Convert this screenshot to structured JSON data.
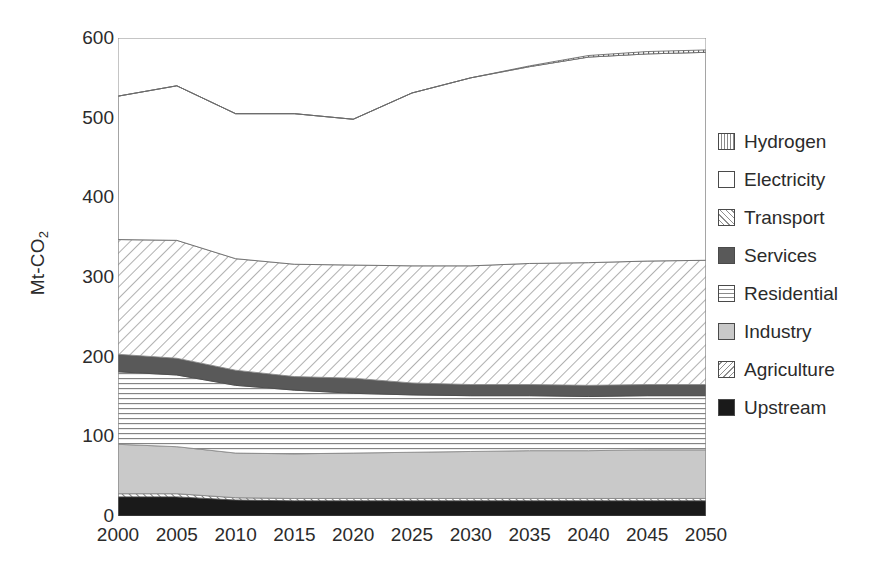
{
  "axes": {
    "ylabel": "Mt-CO",
    "ylabel_sub": "2",
    "yticks": [
      "0",
      "100",
      "200",
      "300",
      "400",
      "500",
      "600"
    ],
    "xticks": [
      "2000",
      "2005",
      "2010",
      "2015",
      "2020",
      "2025",
      "2030",
      "2035",
      "2040",
      "2045",
      "2050"
    ]
  },
  "legend": {
    "items": [
      {
        "label": "Hydrogen",
        "swatch": "hydrogen",
        "icon": "vertical-hatch-swatch-icon"
      },
      {
        "label": "Electricity",
        "swatch": "electricity",
        "icon": "white-swatch-icon"
      },
      {
        "label": "Transport",
        "swatch": "transport",
        "icon": "diagonal-hatch-swatch-icon"
      },
      {
        "label": "Services",
        "swatch": "services",
        "icon": "dark-gray-swatch-icon"
      },
      {
        "label": "Residential",
        "swatch": "residential",
        "icon": "horizontal-hatch-swatch-icon"
      },
      {
        "label": "Industry",
        "swatch": "industry",
        "icon": "light-gray-swatch-icon"
      },
      {
        "label": "Agriculture",
        "swatch": "agriculture",
        "icon": "back-diagonal-hatch-swatch-icon"
      },
      {
        "label": "Upstream",
        "swatch": "upstream",
        "icon": "black-swatch-icon"
      }
    ]
  },
  "chart_data": {
    "type": "area",
    "title": "",
    "xlabel": "",
    "ylabel": "Mt-CO2",
    "stacked": true,
    "grid": false,
    "legend_position": "right",
    "xlim": [
      2000,
      2050
    ],
    "ylim": [
      0,
      600
    ],
    "x": [
      2000,
      2005,
      2010,
      2015,
      2020,
      2025,
      2030,
      2035,
      2040,
      2045,
      2050
    ],
    "series": [
      {
        "name": "Upstream",
        "values": [
          24,
          24,
          20,
          19,
          19,
          19,
          19,
          19,
          19,
          19,
          19
        ]
      },
      {
        "name": "Agriculture",
        "values": [
          4,
          4,
          3,
          3,
          3,
          3,
          3,
          3,
          3,
          3,
          3
        ]
      },
      {
        "name": "Industry",
        "values": [
          62,
          59,
          56,
          56,
          57,
          58,
          59,
          60,
          60,
          61,
          61
        ]
      },
      {
        "name": "Residential",
        "values": [
          91,
          90,
          85,
          80,
          75,
          72,
          70,
          69,
          68,
          68,
          68
        ]
      },
      {
        "name": "Services",
        "values": [
          22,
          21,
          19,
          17,
          19,
          15,
          14,
          14,
          14,
          14,
          14
        ]
      },
      {
        "name": "Transport",
        "values": [
          144,
          148,
          140,
          141,
          142,
          147,
          149,
          152,
          154,
          155,
          156
        ]
      },
      {
        "name": "Electricity",
        "values": [
          180,
          194,
          182,
          189,
          183,
          217,
          236,
          247,
          258,
          261,
          261
        ]
      },
      {
        "name": "Hydrogen",
        "values": [
          0,
          0,
          0,
          0,
          0,
          0,
          0,
          1,
          2,
          3,
          3
        ]
      }
    ],
    "totals": [
      527,
      540,
      505,
      505,
      498,
      531,
      550,
      565,
      578,
      583,
      585
    ],
    "band_tops": {
      "upstream": [
        24,
        24,
        20,
        19,
        19,
        19,
        19,
        19,
        19,
        19,
        19
      ],
      "agriculture": [
        28,
        28,
        23,
        22,
        22,
        22,
        22,
        22,
        22,
        22,
        22
      ],
      "industry": [
        90,
        87,
        79,
        78,
        79,
        80,
        81,
        82,
        82,
        83,
        83
      ],
      "residential": [
        181,
        177,
        164,
        158,
        154,
        152,
        151,
        151,
        150,
        151,
        151
      ],
      "services": [
        203,
        198,
        183,
        175,
        173,
        167,
        165,
        165,
        164,
        165,
        165
      ],
      "transport": [
        347,
        346,
        323,
        316,
        315,
        314,
        314,
        317,
        318,
        320,
        321
      ],
      "electricity": [
        527,
        540,
        505,
        505,
        498,
        531,
        550,
        564,
        576,
        580,
        582
      ],
      "hydrogen": [
        527,
        540,
        505,
        505,
        498,
        531,
        550,
        565,
        578,
        583,
        585
      ]
    }
  }
}
